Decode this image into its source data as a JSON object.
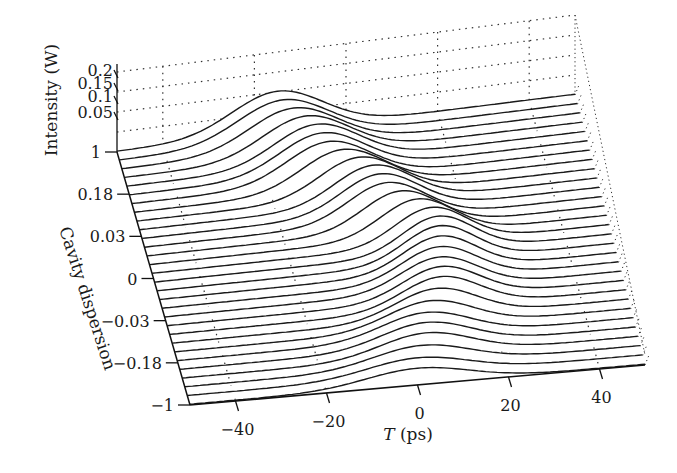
{
  "chart_data": {
    "type": "waterfall-3d-line",
    "title": "",
    "xlabel": "T (ps)",
    "ylabel": "Cavity dispersion",
    "zlabel": "Intensity (W)",
    "x_ticks": [
      -40,
      -20,
      0,
      20,
      40
    ],
    "x_range": [
      -50,
      50
    ],
    "y_ticks": [
      "1",
      "0.18",
      "0.03",
      "0",
      "-0.03",
      "-0.18",
      "-1"
    ],
    "z_ticks": [
      "0.2",
      "0.15",
      "0.1",
      "0.05"
    ],
    "z_range": [
      0,
      0.2
    ],
    "num_traces": 30,
    "grid": "dotted",
    "line_color": "#1a1a1a",
    "traces": [
      {
        "dispersion_index": 0,
        "peak_T": -15,
        "peak_intensity": 0.1,
        "width_ps": 14
      },
      {
        "dispersion_index": 5,
        "peak_T": -8,
        "peak_intensity": 0.098,
        "width_ps": 13
      },
      {
        "dispersion_index": 10,
        "peak_T": 2,
        "peak_intensity": 0.095,
        "width_ps": 12
      },
      {
        "dispersion_index": 15,
        "peak_T": 12,
        "peak_intensity": 0.09,
        "width_ps": 11
      },
      {
        "dispersion_index": 20,
        "peak_T": 10,
        "peak_intensity": 0.08,
        "width_ps": 12
      },
      {
        "dispersion_index": 25,
        "peak_T": 4,
        "peak_intensity": 0.06,
        "width_ps": 14
      },
      {
        "dispersion_index": 29,
        "peak_T": 0,
        "peak_intensity": 0.04,
        "width_ps": 16
      }
    ]
  },
  "labels": {
    "z_axis_title": "Intensity (W)",
    "y_axis_title": "Cavity dispersion",
    "x_axis_title_italic": "T",
    "x_axis_title_unit": " (ps)"
  }
}
